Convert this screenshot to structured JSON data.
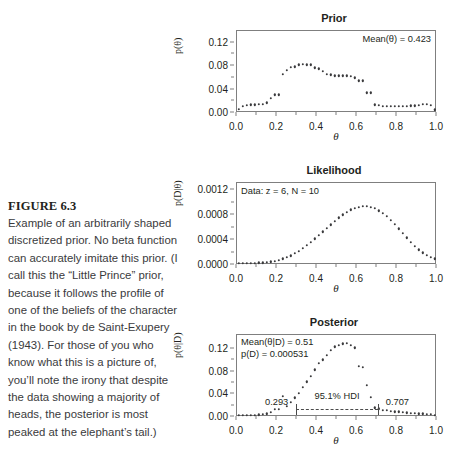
{
  "figure": {
    "label": "FIGURE 6.3",
    "caption": "Example of an arbitrarily shaped discretized prior. No beta function can accurately imitate this prior. (I call this the “Little Prince” prior, because it follows the profile of one of the beliefs of the character in the book by de Saint-Exupery (1943). For those of you who know what this is a picture of, you’ll note the irony that despite the data showing a majority of heads, the posterior is most peaked at the elephant’s tail.)"
  },
  "panels": {
    "prior": {
      "title": "Prior",
      "xlabel": "θ",
      "ylabel": "p(θ)",
      "annotation": "Mean(θ) = 0.423"
    },
    "likelihood": {
      "title": "Likelihood",
      "xlabel": "θ",
      "ylabel": "p(D|θ)",
      "annotation": "Data: z = 6, N = 10"
    },
    "posterior": {
      "title": "Posterior",
      "xlabel": "θ",
      "ylabel": "p(θ|D)",
      "annotation_mean": "Mean(θ|D) = 0.51",
      "annotation_pd": "p(D) = 0.000531",
      "hdi_label": "95.1% HDI",
      "hdi_low": "0.293",
      "hdi_high": "0.707"
    }
  },
  "chart_data": [
    {
      "type": "scatter",
      "title": "Prior",
      "xlabel": "θ",
      "ylabel": "p(θ)",
      "xlim": [
        0.0,
        1.0
      ],
      "ylim": [
        0.0,
        0.14
      ],
      "xticks": [
        "0.0",
        "0.2",
        "0.4",
        "0.6",
        "0.8",
        "1.0"
      ],
      "xtick_values": [
        0.0,
        0.2,
        0.4,
        0.6,
        0.8,
        1.0
      ],
      "yticks": [
        "0.00",
        "0.04",
        "0.08",
        "0.12"
      ],
      "ytick_values": [
        0.0,
        0.04,
        0.08,
        0.12
      ],
      "grid": false,
      "annotations": [
        "Mean(θ) = 0.423"
      ],
      "x": [
        0.01,
        0.03,
        0.05,
        0.07,
        0.09,
        0.11,
        0.13,
        0.15,
        0.17,
        0.19,
        0.21,
        0.23,
        0.25,
        0.27,
        0.29,
        0.31,
        0.33,
        0.35,
        0.37,
        0.39,
        0.41,
        0.43,
        0.45,
        0.47,
        0.49,
        0.51,
        0.53,
        0.55,
        0.57,
        0.59,
        0.61,
        0.63,
        0.65,
        0.67,
        0.69,
        0.71,
        0.73,
        0.75,
        0.77,
        0.79,
        0.81,
        0.83,
        0.85,
        0.87,
        0.89,
        0.91,
        0.93,
        0.95,
        0.97,
        0.99
      ],
      "y": [
        0.003,
        0.008,
        0.01,
        0.011,
        0.011,
        0.012,
        0.012,
        0.014,
        0.022,
        0.028,
        0.028,
        0.063,
        0.07,
        0.075,
        0.076,
        0.079,
        0.08,
        0.079,
        0.079,
        0.074,
        0.072,
        0.068,
        0.063,
        0.062,
        0.06,
        0.06,
        0.06,
        0.06,
        0.059,
        0.057,
        0.052,
        0.052,
        0.031,
        0.031,
        0.011,
        0.01,
        0.008,
        0.008,
        0.008,
        0.008,
        0.008,
        0.008,
        0.008,
        0.009,
        0.009,
        0.01,
        0.012,
        0.012,
        0.01,
        0.002
      ]
    },
    {
      "type": "scatter",
      "title": "Likelihood",
      "xlabel": "θ",
      "ylabel": "p(D|θ)",
      "xlim": [
        0.0,
        1.0
      ],
      "ylim": [
        0.0,
        0.00132
      ],
      "xticks": [
        "0.0",
        "0.2",
        "0.4",
        "0.6",
        "0.8",
        "1.0"
      ],
      "xtick_values": [
        0.0,
        0.2,
        0.4,
        0.6,
        0.8,
        1.0
      ],
      "yticks": [
        "0.0000",
        "0.0004",
        "0.0008",
        "0.0012"
      ],
      "ytick_values": [
        0.0,
        0.0004,
        0.0008,
        0.0012
      ],
      "grid": false,
      "annotations": [
        "Data: z = 6, N = 10"
      ],
      "x": [
        0.01,
        0.03,
        0.05,
        0.07,
        0.09,
        0.11,
        0.13,
        0.15,
        0.17,
        0.19,
        0.21,
        0.23,
        0.25,
        0.27,
        0.29,
        0.31,
        0.33,
        0.35,
        0.37,
        0.39,
        0.41,
        0.43,
        0.45,
        0.47,
        0.49,
        0.51,
        0.53,
        0.55,
        0.57,
        0.59,
        0.61,
        0.63,
        0.65,
        0.67,
        0.69,
        0.71,
        0.73,
        0.75,
        0.77,
        0.79,
        0.81,
        0.83,
        0.85,
        0.87,
        0.89,
        0.91,
        0.93,
        0.95,
        0.97,
        0.99
      ],
      "y": [
        0.0,
        0.0,
        1e-07,
        4e-07,
        1.3e-06,
        3.1e-06,
        6.5e-06,
        1.2e-05,
        2.02e-05,
        3.18e-05,
        4.73e-05,
        6.71e-05,
        9.15e-05,
        0.0001207,
        0.0001547,
        0.0001934,
        0.0002366,
        0.000284,
        0.0003351,
        0.0003893,
        0.0004458,
        0.0005037,
        0.000562,
        0.0006197,
        0.0006755,
        0.0007283,
        0.0007767,
        0.0008196,
        0.0008557,
        0.0008839,
        0.0009032,
        0.0009127,
        0.0009119,
        0.0009003,
        0.0008779,
        0.0008449,
        0.0008019,
        0.0007498,
        0.0006898,
        0.0006237,
        0.0005532,
        0.0004806,
        0.0004081,
        0.0003382,
        0.000273,
        0.0002145,
        0.0001643,
        0.0001233,
        9.19e-05,
        6.97e-05
      ]
    },
    {
      "type": "scatter",
      "title": "Posterior",
      "xlabel": "θ",
      "ylabel": "p(θ|D)",
      "xlim": [
        0.0,
        1.0
      ],
      "ylim": [
        0.0,
        0.145
      ],
      "xticks": [
        "0.0",
        "0.2",
        "0.4",
        "0.6",
        "0.8",
        "1.0"
      ],
      "xtick_values": [
        0.0,
        0.2,
        0.4,
        0.6,
        0.8,
        1.0
      ],
      "yticks": [
        "0.00",
        "0.04",
        "0.08",
        "0.12"
      ],
      "ytick_values": [
        0.0,
        0.04,
        0.08,
        0.12
      ],
      "grid": false,
      "annotations": [
        "Mean(θ|D) = 0.51",
        "p(D) = 0.000531",
        "95.1% HDI",
        "0.293",
        "0.707"
      ],
      "hdi": {
        "low": 0.293,
        "high": 0.707,
        "level": "95.1% HDI",
        "y": 0.015
      },
      "x": [
        0.01,
        0.03,
        0.05,
        0.07,
        0.09,
        0.11,
        0.13,
        0.15,
        0.17,
        0.19,
        0.21,
        0.23,
        0.25,
        0.27,
        0.29,
        0.31,
        0.33,
        0.35,
        0.37,
        0.39,
        0.41,
        0.43,
        0.45,
        0.47,
        0.49,
        0.51,
        0.53,
        0.55,
        0.57,
        0.59,
        0.61,
        0.63,
        0.65,
        0.67,
        0.69,
        0.71,
        0.73,
        0.75,
        0.77,
        0.79,
        0.81,
        0.83,
        0.85,
        0.87,
        0.89,
        0.91,
        0.93,
        0.95,
        0.97,
        0.99
      ],
      "y": [
        0.0,
        0.0,
        0.0,
        0.0,
        0.0002,
        0.0005,
        0.001,
        0.0021,
        0.0054,
        0.0106,
        0.0106,
        0.0338,
        0.0152,
        0.0222,
        0.0308,
        0.0381,
        0.049,
        0.059,
        0.0682,
        0.08,
        0.092,
        0.098,
        0.106,
        0.115,
        0.121,
        0.123,
        0.126,
        0.127,
        0.124,
        0.119,
        0.086,
        0.085,
        0.053,
        0.032,
        0.013,
        0.011,
        0.0085,
        0.008,
        0.007,
        0.0062,
        0.0056,
        0.0048,
        0.0041,
        0.0036,
        0.0029,
        0.0024,
        0.0022,
        0.0017,
        0.0012,
        0.0002
      ]
    }
  ]
}
